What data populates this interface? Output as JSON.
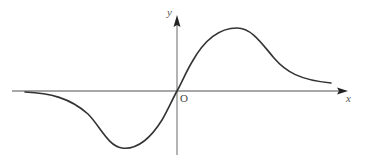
{
  "diagram": {
    "type": "function-graph",
    "labels": {
      "x_axis": "x",
      "y_axis": "y",
      "origin": "O"
    },
    "colors": {
      "axis": "#8a8a8a",
      "curve": "#333333",
      "text": "#555555"
    },
    "key_points": {
      "origin": {
        "x": 177,
        "y": 91
      },
      "maximum": {
        "x": 237,
        "y": 28
      },
      "minimum": {
        "x": 122,
        "y": 148
      },
      "curve_left_end": {
        "x": 25,
        "y": 92
      },
      "curve_right_end": {
        "x": 331,
        "y": 83
      }
    }
  }
}
